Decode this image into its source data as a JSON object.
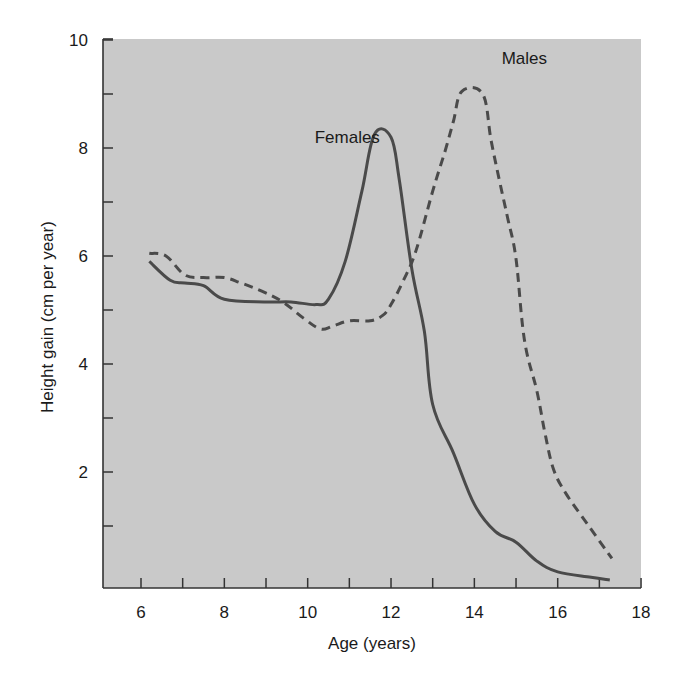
{
  "chart_data": {
    "type": "line",
    "title": "",
    "xlabel": "Age (years)",
    "ylabel": "Height gain (cm per year)",
    "xlim": [
      5.1,
      18
    ],
    "ylim": [
      -0.15,
      10
    ],
    "x_ticks": [
      6,
      7,
      8,
      9,
      10,
      11,
      12,
      13,
      14,
      15,
      16,
      17,
      18
    ],
    "x_tick_labels": [
      "6",
      "8",
      "10",
      "12",
      "14",
      "16",
      "18"
    ],
    "x_tick_label_values": [
      6,
      8,
      10,
      12,
      14,
      16,
      18
    ],
    "y_ticks": [
      1,
      2,
      3,
      4,
      5,
      6,
      7,
      8,
      9,
      10
    ],
    "y_tick_labels": [
      "2",
      "4",
      "6",
      "8",
      "10"
    ],
    "y_tick_label_values": [
      2,
      4,
      6,
      8,
      10
    ],
    "grid": false,
    "legend": "inline labels",
    "background_color": "#c9c9c9",
    "line_color": "#4a4a4a",
    "series": [
      {
        "name": "Females",
        "style": "solid",
        "label_position": {
          "x": 10.95,
          "y": 8.1
        },
        "x": [
          6.2,
          6.7,
          7.05,
          7.5,
          8.0,
          9.0,
          9.6,
          10.2,
          10.5,
          10.9,
          11.3,
          11.6,
          12.0,
          12.2,
          12.5,
          12.8,
          13.0,
          13.5,
          14.0,
          14.5,
          15.0,
          15.5,
          16.0,
          16.8,
          17.25
        ],
        "values": [
          5.9,
          5.55,
          5.5,
          5.45,
          5.2,
          5.15,
          5.15,
          5.1,
          5.2,
          5.9,
          7.2,
          8.25,
          8.2,
          7.4,
          5.75,
          4.6,
          3.25,
          2.35,
          1.4,
          0.9,
          0.7,
          0.35,
          0.15,
          0.05,
          0.0
        ]
      },
      {
        "name": "Males",
        "style": "dashed",
        "label_position": {
          "x": 15.2,
          "y": 9.55
        },
        "x": [
          6.2,
          6.6,
          7.05,
          7.5,
          8.0,
          8.4,
          8.9,
          9.4,
          9.9,
          10.3,
          10.6,
          11.0,
          11.5,
          11.8,
          12.0,
          12.3,
          12.6,
          13.0,
          13.3,
          13.5,
          13.7,
          14.2,
          14.4,
          14.6,
          14.8,
          15.0,
          15.2,
          15.5,
          15.7,
          15.9,
          16.2,
          16.7,
          17.3
        ],
        "values": [
          6.05,
          6.0,
          5.65,
          5.6,
          5.6,
          5.5,
          5.35,
          5.15,
          4.85,
          4.65,
          4.7,
          4.8,
          4.8,
          4.9,
          5.1,
          5.55,
          6.1,
          7.2,
          7.95,
          8.5,
          9.05,
          9.0,
          8.15,
          7.4,
          6.7,
          5.95,
          4.45,
          3.5,
          2.7,
          2.05,
          1.6,
          1.05,
          0.4
        ]
      }
    ]
  }
}
